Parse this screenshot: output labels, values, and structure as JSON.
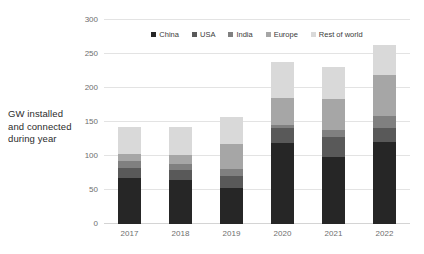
{
  "chart_data": {
    "type": "bar",
    "stacked": true,
    "title": "",
    "subtitle": "",
    "xlabel": "",
    "ylabel": "GW installed and connected during year",
    "ylabel_lines": [
      "GW installed",
      "and connected",
      "during year"
    ],
    "categories": [
      "2017",
      "2018",
      "2019",
      "2020",
      "2021",
      "2022"
    ],
    "ylim": [
      0,
      300
    ],
    "yticks": [
      0,
      50,
      100,
      150,
      200,
      250,
      300
    ],
    "ytick_labels": [
      "0",
      "50",
      "100",
      "150",
      "200",
      "250",
      "300"
    ],
    "grid": true,
    "legend_position": "top-center",
    "series": [
      {
        "name": "China",
        "color": "#262626",
        "values": [
          68,
          64,
          53,
          119,
          98,
          120
        ]
      },
      {
        "name": "USA",
        "color": "#595959",
        "values": [
          14,
          15,
          17,
          22,
          30,
          21
        ]
      },
      {
        "name": "India",
        "color": "#808080",
        "values": [
          10,
          10,
          11,
          5,
          11,
          18
        ]
      },
      {
        "name": "Europe",
        "color": "#a6a6a6",
        "values": [
          11,
          13,
          36,
          40,
          45,
          60
        ]
      },
      {
        "name": "Rest of world",
        "color": "#d9d9d9",
        "values": [
          39,
          40,
          40,
          52,
          47,
          44
        ]
      }
    ],
    "totals": [
      142,
      142,
      157,
      238,
      231,
      263
    ]
  },
  "style": {
    "background": "#ffffff",
    "gridline_color": "#e3e3e3",
    "axis_text_color": "#6e6e6e",
    "title_text_color": "#2b2b2b"
  }
}
